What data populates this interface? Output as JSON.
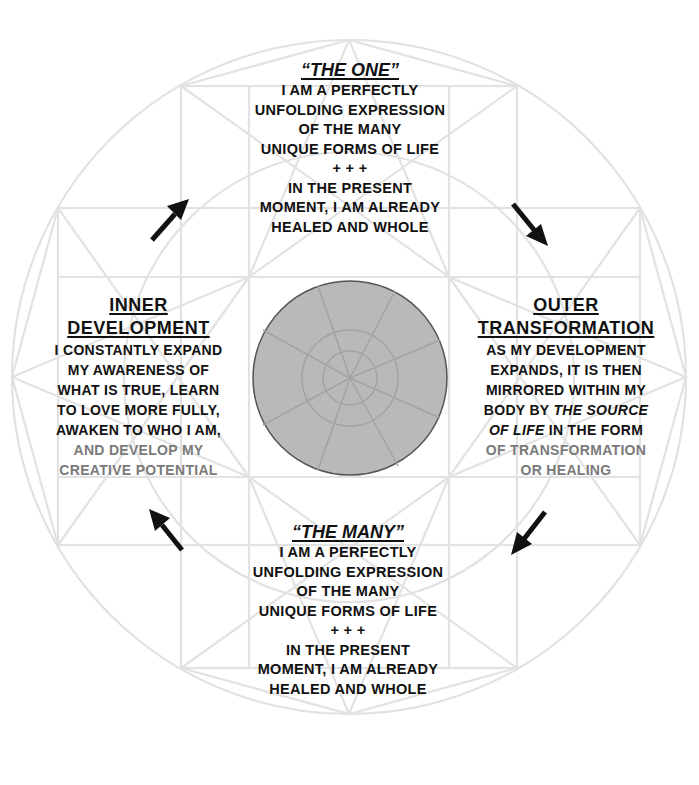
{
  "diagram": {
    "type": "cycle-diagram",
    "colors": {
      "text": "#111111",
      "faded_text": "#7a7a7a",
      "geometry_lines": "#e2e2e2",
      "center_fill": "#b9b9b9",
      "center_stroke": "#555555",
      "arrows": "#111111"
    },
    "top": {
      "title": "“THE ONE”",
      "lines": [
        "I AM A PERFECTLY",
        "UNFOLDING EXPRESSION",
        "OF THE MANY",
        "UNIQUE FORMS OF LIFE",
        "+ + +",
        "IN THE PRESENT",
        "MOMENT, I AM ALREADY",
        "HEALED AND WHOLE"
      ]
    },
    "left": {
      "title_1": "INNER",
      "title_2": "DEVELOPMENT",
      "lines": [
        "I CONSTANTLY EXPAND",
        "MY AWARENESS OF",
        "WHAT IS TRUE, LEARN",
        "TO LOVE MORE FULLY,",
        "AWAKEN TO WHO I AM,"
      ],
      "faded_lines": [
        "AND DEVELOP MY",
        "CREATIVE POTENTIAL"
      ]
    },
    "right": {
      "title_1": "OUTER",
      "title_2": "TRANSFORMATION",
      "lines": [
        "AS MY DEVELOPMENT",
        "EXPANDS, IT IS THEN",
        "MIRRORED WITHIN MY"
      ],
      "line4_prefix": "BODY BY ",
      "line4_italic": "THE SOURCE",
      "line5_italic": "OF LIFE",
      "line5_suffix": " IN THE FORM",
      "faded_lines": [
        "OF TRANSFORMATION",
        "OR HEALING"
      ]
    },
    "bottom": {
      "title": "“THE MANY”",
      "lines": [
        "I AM A PERFECTLY",
        "UNFOLDING EXPRESSION",
        "OF THE MANY",
        "UNIQUE FORMS OF LIFE",
        "+ + +",
        "IN THE PRESENT",
        "MOMENT, I AM ALREADY",
        "HEALED AND WHOLE"
      ]
    },
    "arrows": [
      {
        "name": "arrow-inner-to-one",
        "direction": "up-right"
      },
      {
        "name": "arrow-one-to-outer",
        "direction": "down-right"
      },
      {
        "name": "arrow-outer-to-many",
        "direction": "down-left"
      },
      {
        "name": "arrow-many-to-inner",
        "direction": "up-left"
      }
    ]
  }
}
